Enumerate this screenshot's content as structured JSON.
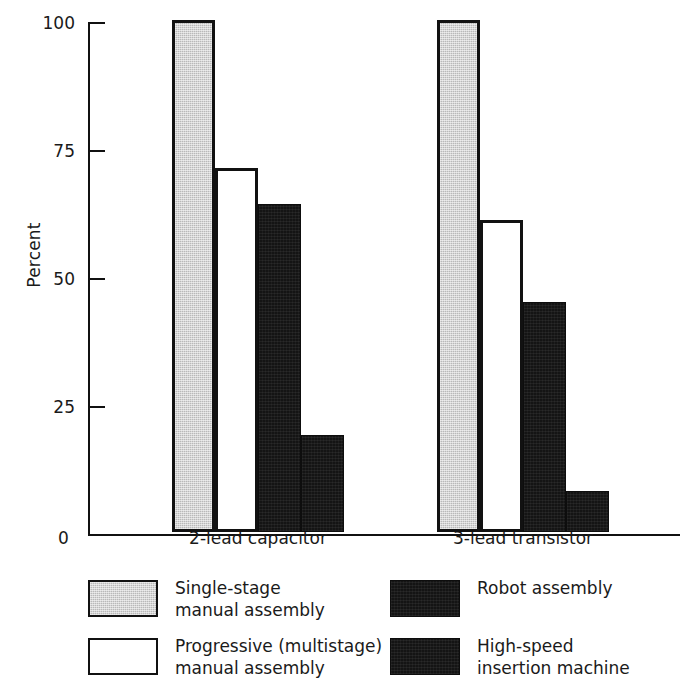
{
  "chart_data": {
    "type": "bar",
    "title": "",
    "xlabel": "",
    "ylabel": "Percent",
    "ylim": [
      0,
      100
    ],
    "yticks": [
      0,
      25,
      50,
      75,
      100
    ],
    "ytick_labels": [
      "0",
      "25",
      "50",
      "75",
      "100"
    ],
    "grid": false,
    "legend_position": "below-plot-two-columns",
    "grouping": "grouped-adjacent-bars",
    "categories": [
      "2-lead capacitor",
      "3-lead transistor"
    ],
    "series": [
      {
        "name": "Single-stage\nmanual assembly",
        "color": "#b9b9b9",
        "edge_color": "#111111",
        "values": [
          100,
          100
        ]
      },
      {
        "name": "Progressive (multistage)\nmanual assembly",
        "color": "#ffffff",
        "edge_color": "#111111",
        "values": [
          71,
          61
        ]
      },
      {
        "name": "Robot assembly",
        "color": "#141414",
        "edge_color": "#0d0d0d",
        "values": [
          64,
          45
        ]
      },
      {
        "name": "High-speed\ninsertion machine",
        "color": "#141414",
        "edge_color": "#0d0d0d",
        "values": [
          19,
          8
        ]
      }
    ]
  },
  "axis": {
    "y_label": "Percent",
    "zero_label": "0",
    "ticks": [
      {
        "value": 100,
        "label": "100"
      },
      {
        "value": 75,
        "label": "75"
      },
      {
        "value": 50,
        "label": "50"
      },
      {
        "value": 25,
        "label": "25"
      }
    ]
  },
  "categories": [
    {
      "label": "2-lead capacitor"
    },
    {
      "label": "3-lead transistor"
    }
  ],
  "legend": {
    "items": [
      {
        "label": "Single-stage\nmanual assembly",
        "swatch": "gray",
        "name": "single-stage-manual-assembly"
      },
      {
        "label": "Robot assembly",
        "swatch": "black",
        "name": "robot-assembly"
      },
      {
        "label": "Progressive (multistage)\nmanual assembly",
        "swatch": "white",
        "name": "progressive-multistage-manual-assembly"
      },
      {
        "label": "High-speed\ninsertion machine",
        "swatch": "black",
        "name": "high-speed-insertion-machine"
      }
    ]
  }
}
